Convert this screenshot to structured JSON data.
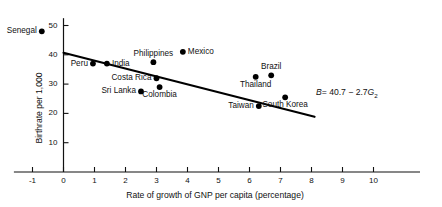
{
  "chart_data": {
    "type": "scatter",
    "title": "",
    "xlabel": "Rate of growth of GNP per capita (percentage)",
    "ylabel": "Birthrate per 1,000",
    "xlim": [
      -1.6,
      11.5
    ],
    "ylim": [
      0,
      53
    ],
    "xticks": [
      -1,
      0,
      1,
      2,
      3,
      4,
      5,
      6,
      7,
      8,
      9,
      10
    ],
    "xticklabels": [
      "-1",
      "0",
      "1",
      "2",
      "3",
      "4",
      "5",
      "6",
      "7",
      "8",
      "9",
      "10"
    ],
    "yticks": [
      10,
      20,
      30,
      40,
      50
    ],
    "yticklabels": [
      "10",
      "20",
      "30",
      "40",
      "50"
    ],
    "grid": false,
    "legend": false,
    "points": [
      {
        "label": "Senegal",
        "x": -0.7,
        "y": 48.0,
        "label_pos": "left"
      },
      {
        "label": "Peru",
        "x": 0.95,
        "y": 37.0,
        "label_pos": "left"
      },
      {
        "label": "India",
        "x": 1.4,
        "y": 37.0,
        "label_pos": "right"
      },
      {
        "label": "Sri Lanka",
        "x": 2.5,
        "y": 27.5,
        "label_pos": "left"
      },
      {
        "label": "Costa Rica",
        "x": 3.0,
        "y": 32.0,
        "label_pos": "left"
      },
      {
        "label": "Philippines",
        "x": 2.9,
        "y": 37.5,
        "label_pos": "above"
      },
      {
        "label": "Colombia",
        "x": 3.1,
        "y": 29.0,
        "label_pos": "below"
      },
      {
        "label": "Mexico",
        "x": 3.85,
        "y": 41.0,
        "label_pos": "right"
      },
      {
        "label": "Thailand",
        "x": 6.2,
        "y": 32.5,
        "label_pos": "below"
      },
      {
        "label": "Brazil",
        "x": 6.7,
        "y": 33.0,
        "label_pos": "above"
      },
      {
        "label": "Taiwan",
        "x": 6.3,
        "y": 22.5,
        "label_pos": "left"
      },
      {
        "label": "South Korea",
        "x": 7.15,
        "y": 25.5,
        "label_pos": "below"
      }
    ],
    "fit_line": {
      "equation_text": "B = 40.7 - 2.7G",
      "equation_b_symbol": "B",
      "equation_rhs": "= 40.7 − 2.7",
      "equation_g_symbol": "G",
      "equation_g_subscript": "2",
      "intercept": 40.7,
      "slope": -2.7,
      "x_start": 0.0,
      "x_end": 8.1
    },
    "marker_color": "#000000",
    "line_color": "#000000",
    "axis_color": "#111111"
  }
}
